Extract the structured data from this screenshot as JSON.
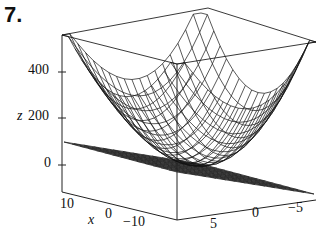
{
  "problem_number": "7.",
  "chart_data": {
    "type": "surface3d",
    "title": "",
    "z_axis": {
      "label": "z",
      "ticks": [
        "400",
        "200",
        "0"
      ],
      "range": [
        0,
        500
      ]
    },
    "x_axis": {
      "label": "x",
      "ticks": [
        "10",
        "0",
        "−10"
      ]
    },
    "y_axis": {
      "label": "y",
      "ticks": [
        "5",
        "0",
        "−5"
      ]
    },
    "surfaces": [
      {
        "name": "bowl",
        "shape": "paraboloid",
        "style": "wireframe"
      },
      {
        "name": "plane",
        "z": 0,
        "style": "wireframe"
      }
    ]
  },
  "labels": {
    "z_ticks": [
      "400",
      "200",
      "0"
    ],
    "x_ticks": [
      "10",
      "0",
      "−10"
    ],
    "y_ticks": [
      "5",
      "0",
      "−5"
    ],
    "z_label": "z",
    "x_label": "x"
  }
}
